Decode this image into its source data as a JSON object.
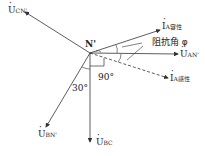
{
  "diagram": {
    "type": "phasor-diagram",
    "origin_label": "N'",
    "phasors": [
      {
        "id": "ucn",
        "symbol": "U",
        "subscript": "CN'"
      },
      {
        "id": "ia_cap",
        "symbol": "I",
        "subscript": "A容性"
      },
      {
        "id": "uan",
        "symbol": "U",
        "subscript": "AN'"
      },
      {
        "id": "ia_ind",
        "symbol": "I",
        "subscript": "A感性"
      },
      {
        "id": "ubn",
        "symbol": "U",
        "subscript": "BN'"
      },
      {
        "id": "ubc",
        "symbol": "U",
        "subscript": "BC"
      }
    ],
    "annotations": {
      "impedance_angle": "阻抗角 φ",
      "angle_30": "30°",
      "angle_90": "90°"
    },
    "colors": {
      "line": "#333333",
      "text": "#222222"
    }
  }
}
